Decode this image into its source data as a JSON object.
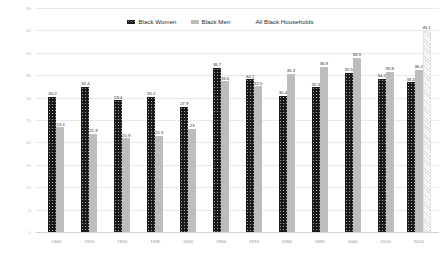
{
  "chart_data": {
    "type": "bar",
    "title": "",
    "xlabel": "",
    "ylabel": "",
    "ylim": [
      0,
      50
    ],
    "yticks": [
      0,
      5,
      10,
      15,
      20,
      25,
      30,
      35,
      40,
      45,
      50
    ],
    "grid": true,
    "legend_position": "top-center",
    "categories": [
      "1900",
      "1910",
      "1920",
      "1930",
      "1940",
      "1960",
      "1970",
      "1980",
      "1990",
      "2000",
      "2010",
      "2014"
    ],
    "series": [
      {
        "name": "Black Women",
        "color": "#1a1a1a",
        "pattern": "dotted",
        "values": [
          30.2,
          32.4,
          29.4,
          30.2,
          27.9,
          36.7,
          34.1,
          30.4,
          32.3,
          35.5,
          34.2,
          33.4
        ],
        "labels": [
          "30.2",
          "32.4",
          "29.4",
          "30.2",
          "27.9",
          "36.7",
          "34.1",
          "30.4",
          "32.3",
          "35.5",
          "34.2",
          "33.4"
        ]
      },
      {
        "name": "Black Men",
        "color": "#bdbdbd",
        "pattern": "solid",
        "values": [
          23.4,
          21.9,
          20.9,
          21.5,
          23,
          33.6,
          32.5,
          35.3,
          36.9,
          38.9,
          35.8,
          36.2
        ],
        "labels": [
          "23.4",
          "21.9",
          "20.9",
          "21.5",
          "23",
          "33.6",
          "32.5",
          "35.3",
          "36.9",
          "38.9",
          "35.8",
          "36.2"
        ]
      },
      {
        "name": "All Black Households",
        "color": "#f4f4f4",
        "pattern": "hatched",
        "values": [
          null,
          null,
          null,
          null,
          null,
          null,
          null,
          null,
          null,
          null,
          null,
          45.1
        ],
        "labels": [
          "",
          "",
          "",
          "",
          "",
          "",
          "",
          "",
          "",
          "",
          "",
          "45.1"
        ]
      }
    ]
  },
  "legend": {
    "items": [
      {
        "label": "Black Women"
      },
      {
        "label": "Black Men"
      },
      {
        "label": "All Black Households"
      }
    ]
  }
}
